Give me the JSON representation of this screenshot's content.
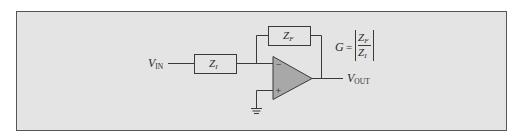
{
  "diagram": {
    "colors": {
      "panel_bg": "#e4e4e4",
      "panel_border": "#555555",
      "opamp_fill": "#a8a8a8",
      "line": "#3a3a3a"
    },
    "labels": {
      "vin_main": "V",
      "vin_sub": "IN",
      "vout_main": "V",
      "vout_sub": "OUT",
      "zi_main": "Z",
      "zi_sub": "I",
      "zf_main": "Z",
      "zf_sub": "F",
      "minus": "−",
      "plus": "+"
    },
    "formula": {
      "lhs": "G",
      "equals": "=",
      "num_main": "Z",
      "num_sub": "F",
      "den_main": "Z",
      "den_sub": "I"
    },
    "components": [
      {
        "id": "zi",
        "type": "impedance",
        "label": "Z_I"
      },
      {
        "id": "zf",
        "type": "impedance",
        "label": "Z_F",
        "role": "feedback"
      },
      {
        "id": "opamp",
        "type": "op-amp",
        "inputs": [
          "−",
          "+"
        ]
      },
      {
        "id": "gnd",
        "type": "ground"
      }
    ]
  }
}
